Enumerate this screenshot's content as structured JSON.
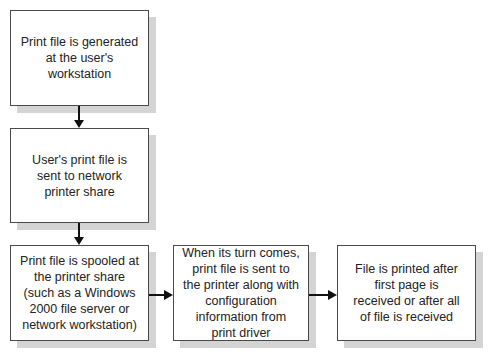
{
  "diagram": {
    "type": "flowchart",
    "nodes": [
      {
        "id": "n1",
        "label": "Print file is generated at the user's workstation"
      },
      {
        "id": "n2",
        "label": "User's print file is sent to network printer share"
      },
      {
        "id": "n3",
        "label": "Print file is spooled at the printer share (such as a Windows 2000 file server or network workstation)"
      },
      {
        "id": "n4",
        "label": "When its turn comes, print file is sent to the printer along with configuration information from print driver"
      },
      {
        "id": "n5",
        "label": "File is printed after first page is received or after all of file is received"
      }
    ],
    "edges": [
      {
        "from": "n1",
        "to": "n2"
      },
      {
        "from": "n2",
        "to": "n3"
      },
      {
        "from": "n3",
        "to": "n4"
      },
      {
        "from": "n4",
        "to": "n5"
      }
    ],
    "colors": {
      "border": "#4a4a4a",
      "shadow": "#d4d4d4",
      "arrow": "#111111",
      "text": "#222222"
    }
  }
}
